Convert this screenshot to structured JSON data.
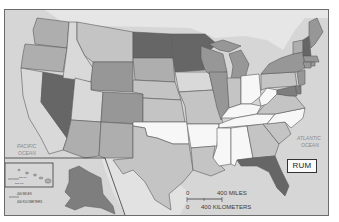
{
  "map": {
    "title_label": "RUM",
    "type": "choropleth",
    "palette": {
      "ocean": "#d6d6d6",
      "land_outside": "#e4e4e4",
      "level_0": "#f7f7f7",
      "level_1": "#d9d9d9",
      "level_2": "#c4c4c4",
      "level_3": "#aeaeae",
      "level_4": "#979797",
      "level_5": "#7e7e7e",
      "level_6": "#666666",
      "border": "#5a5a5a"
    },
    "ocean_labels": {
      "pacific_line1": "PACIFIC",
      "pacific_line2": "OCEAN",
      "atlantic_line1": "ATLANTIC",
      "atlantic_line2": "OCEAN"
    },
    "scale_bar": {
      "miles_zero": "0",
      "miles_label": "400 MILES",
      "km_zero": "0",
      "km_label": "400 KILOMETERS"
    },
    "inset_alaska_scale": {
      "miles_label": "400 MILES",
      "km_label": "400 KILOMETERS"
    },
    "inset_hawaii_scale": {
      "miles_label": "200 MI",
      "km_label": "200 KM"
    },
    "states": {
      "WA": 3,
      "OR": 3,
      "CA": 1,
      "NV": 6,
      "ID": 1,
      "MT": 2,
      "WY": 4,
      "UT": 1,
      "AZ": 3,
      "CO": 4,
      "NM": 3,
      "ND": 6,
      "SD": 3,
      "NE": 2,
      "KS": 2,
      "OK": 0,
      "TX": 2,
      "MN": 6,
      "IA": 1,
      "MO": 2,
      "AR": 0,
      "LA": 2,
      "WI": 4,
      "IL": 4,
      "MI": 4,
      "IN": 2,
      "OH": 0,
      "KY": 0,
      "TN": 0,
      "MS": 0,
      "AL": 0,
      "GA": 2,
      "FL": 6,
      "SC": 2,
      "NC": 0,
      "VA": 2,
      "WV": 0,
      "PA": 2,
      "NY": 4,
      "VT": 3,
      "NH": 6,
      "ME": 4,
      "MA": 4,
      "CT": 4,
      "RI": 4,
      "NJ": 4,
      "DE": 5,
      "MD": 5,
      "AK": 5,
      "HI": 3
    }
  }
}
